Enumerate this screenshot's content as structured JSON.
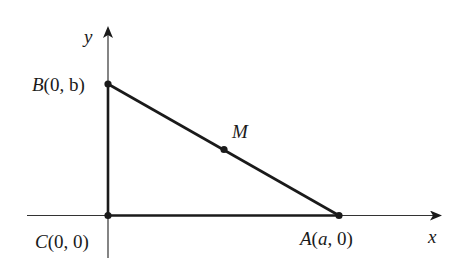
{
  "diagram": {
    "axes": {
      "x_label": "x",
      "y_label": "y"
    },
    "points": {
      "B": {
        "name": "B",
        "coords": "(0, b)"
      },
      "C": {
        "name": "C",
        "coords": "(0, 0)"
      },
      "A": {
        "name": "A",
        "coords": "(a, 0)"
      },
      "M": {
        "name": "M"
      }
    },
    "colors": {
      "stroke": "#1a1a1a",
      "axis": "#333333",
      "background": "#ffffff"
    }
  }
}
